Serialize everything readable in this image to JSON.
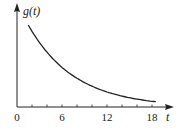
{
  "chart_data": {
    "type": "line",
    "title": "",
    "xlabel": "t",
    "ylabel": "g(t)",
    "xlim": [
      0,
      20
    ],
    "ylim": [
      0,
      11
    ],
    "grid": false,
    "legend": null,
    "x_ticks": [
      0,
      6,
      12,
      18
    ],
    "x_tick_labels": [
      "0",
      "6",
      "12",
      "18"
    ],
    "x_minor_tick_step": 2,
    "y_ticks": [],
    "series": [
      {
        "name": "g(t)",
        "description": "decaying exponential curve",
        "x": [
          1.5,
          3,
          4.5,
          6,
          7.5,
          9,
          10.5,
          12,
          13.5,
          15,
          16.5,
          18.5
        ],
        "y": [
          10.9,
          8.6,
          6.7,
          5.3,
          4.2,
          3.3,
          2.6,
          2.0,
          1.6,
          1.2,
          1.0,
          0.7
        ]
      }
    ]
  }
}
